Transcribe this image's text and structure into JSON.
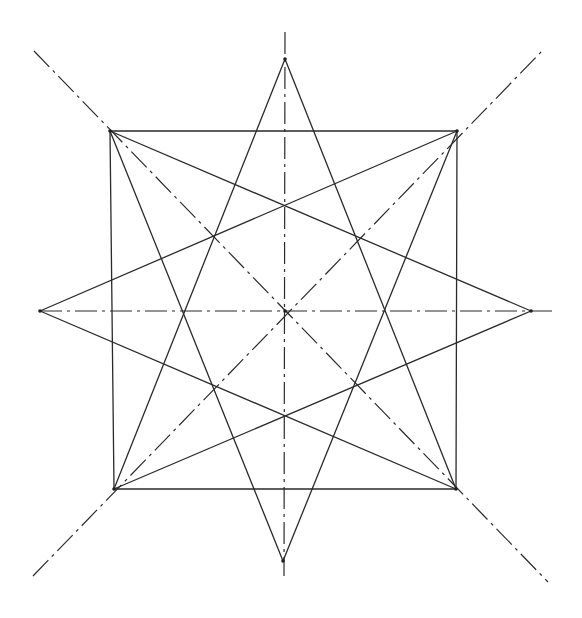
{
  "diagram": {
    "title": "",
    "stroke_color": "#2a2a2a",
    "background": "#ffffff",
    "center": [
      285,
      311
    ],
    "square": {
      "tl": [
        110,
        131
      ],
      "tr": [
        457,
        131
      ],
      "br": [
        456,
        489
      ],
      "bl": [
        114,
        489
      ]
    },
    "star_points": {
      "top": [
        285,
        59
      ],
      "right": [
        531,
        311
      ],
      "bottom": [
        283,
        561
      ],
      "left": [
        40,
        311
      ]
    },
    "star_lines": [
      {
        "from": "top",
        "to": "bl"
      },
      {
        "from": "top",
        "to": "br"
      },
      {
        "from": "bottom",
        "to": "tl"
      },
      {
        "from": "bottom",
        "to": "tr"
      },
      {
        "from": "left",
        "to": "tr"
      },
      {
        "from": "left",
        "to": "br"
      },
      {
        "from": "right",
        "to": "tl"
      },
      {
        "from": "right",
        "to": "bl"
      }
    ],
    "axes": [
      {
        "name": "vertical",
        "from": [
          285,
          32
        ],
        "to": [
          284,
          576
        ],
        "style": "dash-dot"
      },
      {
        "name": "horizontal",
        "from": [
          40,
          311
        ],
        "to": [
          552,
          311
        ],
        "style": "dash-dot"
      },
      {
        "name": "diagonal-nw-se",
        "from": [
          34,
          51
        ],
        "to": [
          548,
          582
        ],
        "style": "dash-dot"
      },
      {
        "name": "diagonal-sw-ne",
        "from": [
          33,
          576
        ],
        "to": [
          543,
          50
        ],
        "style": "dash-dot"
      }
    ]
  }
}
